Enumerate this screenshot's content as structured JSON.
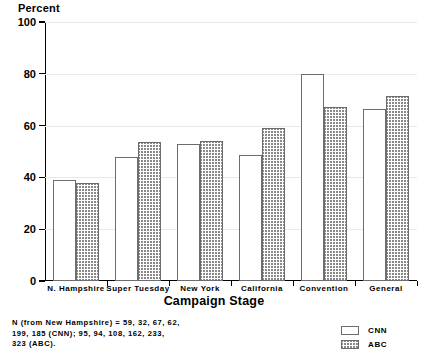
{
  "chart_data": {
    "type": "bar",
    "title": "",
    "ylabel": "Percent",
    "xlabel": "Campaign Stage",
    "ylim": [
      0,
      100
    ],
    "yticks": [
      0,
      20,
      40,
      60,
      80,
      100
    ],
    "grid": true,
    "legend_position": "bottom-right",
    "categories": [
      "N. Hampshire",
      "Super Tuesday",
      "New York",
      "California",
      "Convention",
      "General"
    ],
    "series": [
      {
        "name": "CNN",
        "values": [
          39,
          48,
          53,
          48.5,
          80,
          66.5
        ]
      },
      {
        "name": "ABC",
        "values": [
          38,
          53.5,
          54,
          59,
          67,
          71.5
        ]
      }
    ],
    "annotations": [
      "N (from New Hampshire) = 59, 32, 67, 62,",
      "199, 185 (CNN); 95, 94, 108, 162, 233,",
      "323 (ABC)."
    ]
  },
  "legend": {
    "items": [
      {
        "label": "CNN",
        "style": "white"
      },
      {
        "label": "ABC",
        "style": "hatched"
      }
    ]
  }
}
